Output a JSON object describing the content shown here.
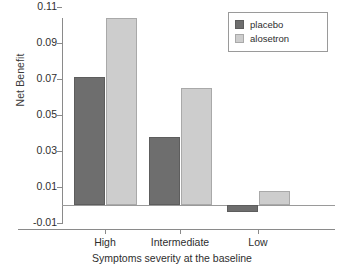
{
  "chart_data": {
    "type": "bar",
    "title": "",
    "subtitle": "",
    "xlabel": "Symptoms severity at the baseline",
    "ylabel": "Net Benefit",
    "categories": [
      "High",
      "Intermediate",
      "Low"
    ],
    "series": [
      {
        "name": "placebo",
        "color": "#6e6e6e",
        "values": [
          0.071,
          0.038,
          -0.004
        ]
      },
      {
        "name": "alosetron",
        "color": "#cdcdcd",
        "values": [
          0.104,
          0.065,
          0.008
        ]
      }
    ],
    "ylim": [
      -0.01,
      0.115
    ],
    "yticks": [
      -0.01,
      0.01,
      0.03,
      0.05,
      0.07,
      0.09,
      0.11
    ],
    "ytick_labels": [
      "-0.01",
      "0.01",
      "0.03",
      "0.05",
      "0.07",
      "0.09",
      "0.11"
    ],
    "grid": false,
    "legend_position": "top-right",
    "zero_reference_line": true
  },
  "legend": {
    "entries": [
      {
        "label": "placebo",
        "swatch": "dark-gray-square"
      },
      {
        "label": "alosetron",
        "swatch": "light-gray-square"
      }
    ]
  }
}
